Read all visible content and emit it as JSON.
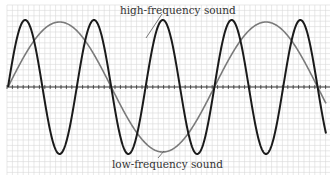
{
  "diagram": {
    "labels": {
      "high": "high-frequency sound",
      "low": "low-frequency sound"
    },
    "colors": {
      "background": "#ffffff",
      "grid": "#d9d9d9",
      "axis": "#333333",
      "high_wave": "#1a1a1a",
      "low_wave": "#7a7a7a",
      "label": "#333333",
      "leader": "#555555"
    },
    "plot_area": {
      "x0": 7,
      "y0": 5,
      "x1": 330,
      "y1": 175,
      "axis_y": 87,
      "grid_step": 5.4
    },
    "waves": {
      "high": {
        "x_start": 8,
        "x_end": 326,
        "period_px": 68.8,
        "amplitude_px": 67,
        "phase": "starts at zero rising"
      },
      "low": {
        "x_start": 8,
        "x_end": 326,
        "period_px": 206.4,
        "amplitude_px": 65,
        "phase": "starts at zero rising"
      },
      "frequency_ratio": 3
    }
  }
}
